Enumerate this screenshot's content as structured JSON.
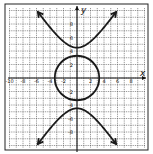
{
  "chart_data": {
    "type": "line",
    "title": "",
    "xlabel": "x",
    "ylabel": "y",
    "xlim": [
      -10,
      10
    ],
    "ylim": [
      -10,
      10
    ],
    "grid": true,
    "grid_step": 1,
    "x_tick_labels": [
      "-10",
      "-8",
      "-6",
      "-4",
      "-2",
      "2",
      "4",
      "6",
      "8"
    ],
    "y_tick_labels": [
      "8",
      "6",
      "4",
      "2",
      "-2",
      "-4",
      "-6",
      "-8"
    ],
    "series": [
      {
        "name": "circle",
        "kind": "circle",
        "center": [
          0,
          0
        ],
        "radius": 3.3,
        "equation": "x^2 + y^2 = 11"
      },
      {
        "name": "hyperbola",
        "kind": "hyperbola-vertical",
        "center": [
          0,
          0
        ],
        "a": 4.5,
        "b": 3.0,
        "equation": "y^2/20.25 - x^2/9 = 1",
        "arrow_ends": [
          [
            -5.8,
            9.3
          ],
          [
            5.8,
            9.3
          ],
          [
            -5.8,
            -9.3
          ],
          [
            5.8,
            -9.3
          ]
        ]
      }
    ],
    "colors": {
      "curve": "#1a1a1a",
      "grid": "#555555",
      "axes": "#111111",
      "frame": "#222222"
    }
  }
}
